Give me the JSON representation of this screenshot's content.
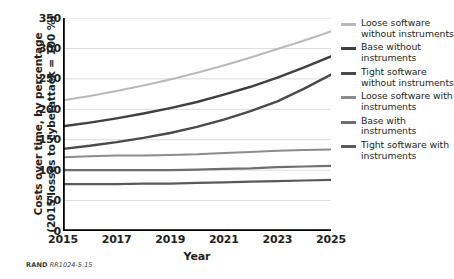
{
  "chart_data": {
    "type": "line",
    "title": "",
    "xlabel": "Year",
    "ylabel": "Costs over time, by percentage (2015 losses to cyberattack = 100%)",
    "ylabel_lines": [
      "Costs over time, by percentage",
      "(2015 losses to cyberattack = 100 %)"
    ],
    "xlim": [
      2015,
      2025
    ],
    "ylim": [
      0,
      350
    ],
    "yticks": [
      0,
      50,
      100,
      150,
      200,
      250,
      300,
      350
    ],
    "ytick_labels": [
      "0",
      "50",
      "100",
      "150",
      "200",
      "250",
      "300",
      "350"
    ],
    "xticks": [
      2015,
      2016,
      2017,
      2018,
      2019,
      2020,
      2021,
      2022,
      2023,
      2024,
      2025
    ],
    "xtick_labels_shown": [
      "2015",
      "2017",
      "2019",
      "2021",
      "2023",
      "2025"
    ],
    "grid": "horizontal",
    "legend_position": "right",
    "x": [
      2015,
      2016,
      2017,
      2018,
      2019,
      2020,
      2021,
      2022,
      2023,
      2024,
      2025
    ],
    "series": [
      {
        "name": "Loose software without instruments",
        "color": "#b9b9b9",
        "width": 2.0,
        "values": [
          215,
          222,
          230,
          239,
          249,
          260,
          272,
          285,
          299,
          313,
          328
        ]
      },
      {
        "name": "Base without instruments",
        "color": "#3f3f3f",
        "width": 2.4,
        "values": [
          172,
          178,
          185,
          193,
          202,
          212,
          224,
          237,
          252,
          269,
          287
        ]
      },
      {
        "name": "Tight software without instruments",
        "color": "#4a4a4a",
        "width": 2.4,
        "values": [
          135,
          140,
          146,
          153,
          161,
          171,
          183,
          197,
          213,
          234,
          257
        ]
      },
      {
        "name": "Loose software with instruments",
        "color": "#8c8c8c",
        "width": 2.0,
        "values": [
          121,
          123,
          124,
          124,
          125,
          126,
          128,
          130,
          132,
          133,
          134
        ]
      },
      {
        "name": "Base with instruments",
        "color": "#6e6e6e",
        "width": 2.2,
        "values": [
          100,
          100,
          100,
          100,
          100,
          101,
          102,
          103,
          105,
          106,
          107
        ]
      },
      {
        "name": "Tight software with instruments",
        "color": "#5a5a5a",
        "width": 2.2,
        "values": [
          77,
          77,
          77,
          78,
          78,
          79,
          80,
          81,
          82,
          83,
          84
        ]
      }
    ]
  },
  "legend": {
    "items": [
      {
        "label": "Loose software without instruments",
        "color": "#b9b9b9"
      },
      {
        "label": "Base without instruments",
        "color": "#3f3f3f"
      },
      {
        "label": "Tight software without instruments",
        "color": "#4a4a4a"
      },
      {
        "label": "Loose software with instruments",
        "color": "#8c8c8c"
      },
      {
        "label": "Base with instruments",
        "color": "#6e6e6e"
      },
      {
        "label": "Tight software with instruments",
        "color": "#5a5a5a"
      }
    ]
  },
  "source_note": {
    "mark": "RAND",
    "id": "RR1024-5.15"
  }
}
